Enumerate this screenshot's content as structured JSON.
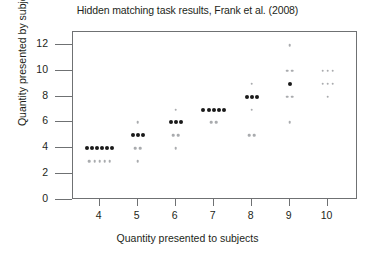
{
  "chart_data": {
    "type": "scatter",
    "title": "Hidden matching task results, Frank et al. (2008)",
    "xlabel": "Quantity presented to subjects",
    "ylabel": "Quantity presented by subjects",
    "xlim": [
      3.3,
      10.8
    ],
    "ylim": [
      0,
      13
    ],
    "xticks": [
      4,
      5,
      6,
      7,
      8,
      9,
      10
    ],
    "yticks": [
      0,
      2,
      4,
      6,
      8,
      10,
      12
    ],
    "grid": false,
    "legend": null,
    "marker_color": "#1a1a1a",
    "frame_color": "#6f7173",
    "note": "Each dot is one trial; dots are jittered horizontally within each x category. Darker/denser rows indicate the modal response.",
    "points": [
      {
        "x": 4,
        "y": 4,
        "count": 6,
        "weight": "dark"
      },
      {
        "x": 4,
        "y": 3,
        "count": 5,
        "weight": "light"
      },
      {
        "x": 5,
        "y": 6,
        "count": 1,
        "weight": "light"
      },
      {
        "x": 5,
        "y": 5,
        "count": 3,
        "weight": "dark"
      },
      {
        "x": 5,
        "y": 4,
        "count": 2,
        "weight": "light"
      },
      {
        "x": 5,
        "y": 3,
        "count": 1,
        "weight": "light"
      },
      {
        "x": 6,
        "y": 7,
        "count": 1,
        "weight": "light"
      },
      {
        "x": 6,
        "y": 6,
        "count": 3,
        "weight": "dark"
      },
      {
        "x": 6,
        "y": 5,
        "count": 2,
        "weight": "light"
      },
      {
        "x": 6,
        "y": 4,
        "count": 1,
        "weight": "light"
      },
      {
        "x": 7,
        "y": 7,
        "count": 5,
        "weight": "dark"
      },
      {
        "x": 7,
        "y": 6,
        "count": 2,
        "weight": "light"
      },
      {
        "x": 8,
        "y": 9,
        "count": 1,
        "weight": "light"
      },
      {
        "x": 8,
        "y": 8,
        "count": 3,
        "weight": "dark"
      },
      {
        "x": 8,
        "y": 7,
        "count": 1,
        "weight": "light"
      },
      {
        "x": 8,
        "y": 5,
        "count": 2,
        "weight": "light"
      },
      {
        "x": 9,
        "y": 12,
        "count": 1,
        "weight": "light"
      },
      {
        "x": 9,
        "y": 10,
        "count": 2,
        "weight": "light"
      },
      {
        "x": 9,
        "y": 9,
        "count": 1,
        "weight": "dark"
      },
      {
        "x": 9,
        "y": 8,
        "count": 2,
        "weight": "light"
      },
      {
        "x": 9,
        "y": 6,
        "count": 1,
        "weight": "light"
      },
      {
        "x": 10,
        "y": 10,
        "count": 3,
        "weight": "light"
      },
      {
        "x": 10,
        "y": 9,
        "count": 3,
        "weight": "light"
      },
      {
        "x": 10,
        "y": 8,
        "count": 1,
        "weight": "light"
      }
    ]
  }
}
